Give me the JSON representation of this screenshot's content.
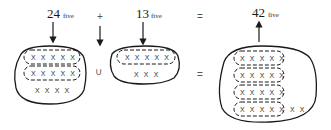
{
  "equation": {
    "term1": {
      "value": "24",
      "base": "five"
    },
    "plus": "+",
    "term2": {
      "value": "13",
      "base": "five"
    },
    "equals": "=",
    "result": {
      "value": "42",
      "base": "five"
    }
  },
  "sets": {
    "union_symbol": "∪",
    "equals_symbol": "=",
    "left": {
      "groups": [
        "X X X X X",
        "X X X X X"
      ],
      "ones": "X X X X"
    },
    "middle": {
      "groups": [
        "X X X X X"
      ],
      "ones": "X X X"
    },
    "right": {
      "groups": [
        "X X X X X",
        "X X X X X",
        "X X X X X",
        "X X X X X"
      ],
      "ones": "X X"
    }
  }
}
